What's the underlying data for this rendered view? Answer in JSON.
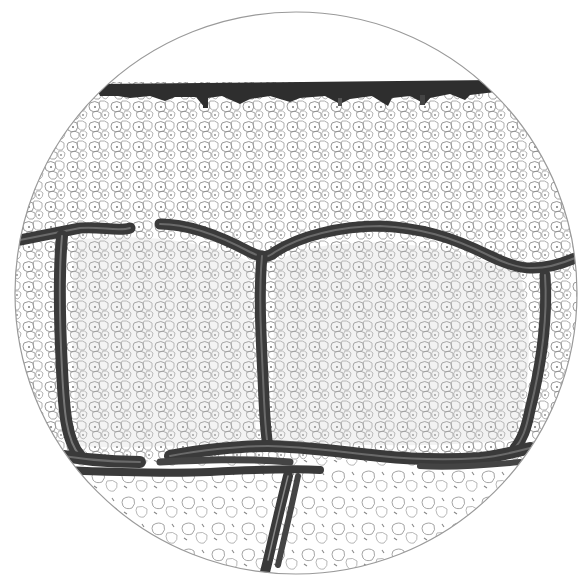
{
  "figure": {
    "field": {
      "shape": "circle",
      "cx": 296,
      "cy": 293,
      "r": 281,
      "border_color": "#9a9a9a"
    },
    "colors": {
      "background": "#ffffff",
      "cell_outline": "#8c8c8c",
      "cell_nucleus": "#7a7a7a",
      "septum": "#3a3a3a",
      "septum_highlight": "#6a6a6a",
      "top_layer": "#2e2e2e"
    },
    "regions": [
      {
        "name": "top-dark-layer",
        "y": 80
      },
      {
        "name": "upper-cell-zone"
      },
      {
        "name": "left-lobule"
      },
      {
        "name": "right-lobule"
      },
      {
        "name": "lower-cell-zone"
      }
    ]
  }
}
